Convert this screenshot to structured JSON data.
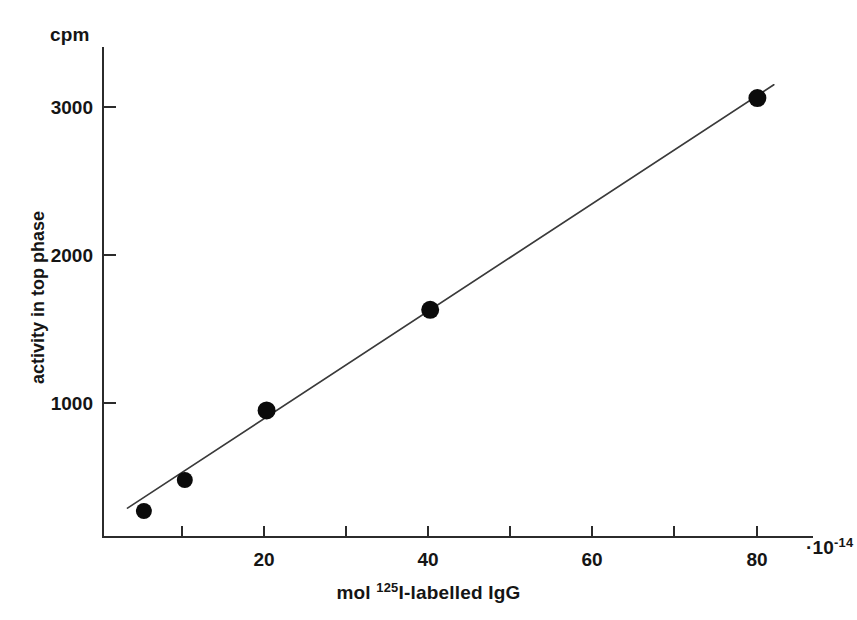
{
  "chart_data": {
    "type": "scatter",
    "title": "",
    "subtitle": "",
    "xlabel": "mol 125I-labelled IgG",
    "ylabel": "activity in top phase",
    "y_unit_label": "cpm",
    "x_multiplier_label": "·10",
    "x_multiplier_exponent": "-14",
    "x_superscript_prefix": "mol ",
    "x_superscript": "125",
    "x_superscript_suffix": "I-labelled IgG",
    "xlim": [
      0,
      87
    ],
    "ylim": [
      0,
      3300
    ],
    "grid": false,
    "legend": null,
    "x_ticks": [
      10,
      20,
      30,
      40,
      50,
      60,
      70,
      80
    ],
    "x_tick_labels": [
      "",
      "20",
      "",
      "40",
      "",
      "60",
      "",
      "80"
    ],
    "y_ticks": [
      1000,
      2000,
      3000
    ],
    "y_tick_labels": [
      "1000",
      "2000",
      "3000"
    ],
    "x": [
      5,
      10,
      20,
      40,
      80
    ],
    "y": [
      270,
      480,
      950,
      1630,
      3060
    ],
    "series": [
      {
        "name": "activity in top phase",
        "marker": "filled-circle",
        "marker_color": "#0b0b0b",
        "points": [
          {
            "x": 5,
            "y": 270
          },
          {
            "x": 10,
            "y": 480
          },
          {
            "x": 20,
            "y": 950
          },
          {
            "x": 40,
            "y": 1630
          },
          {
            "x": 80,
            "y": 3060
          }
        ]
      }
    ],
    "fit_line": {
      "name": "linear fit",
      "color": "#3a3a3a",
      "x_start": 3,
      "y_start": 290,
      "x_end": 82,
      "y_end": 3150
    },
    "annotations": []
  }
}
